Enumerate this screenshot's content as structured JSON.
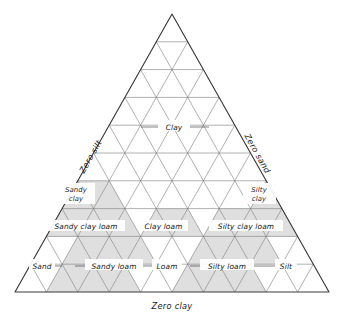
{
  "figure": {
    "name": "soil-texture-triangle",
    "type": "ternary-diagram"
  },
  "axes": {
    "left": {
      "label": "Zero silt"
    },
    "right": {
      "label": "Zero sand"
    },
    "bottom": {
      "label": "Zero clay"
    }
  },
  "regions": [
    {
      "id": "clay",
      "label": "Clay"
    },
    {
      "id": "sandy-clay",
      "label_line1": "Sandy",
      "label_line2": "clay"
    },
    {
      "id": "silty-clay",
      "label_line1": "Silty",
      "label_line2": "clay"
    },
    {
      "id": "sandy-clay-loam",
      "label": "Sandy clay loam"
    },
    {
      "id": "clay-loam",
      "label": "Clay loam"
    },
    {
      "id": "silty-clay-loam",
      "label": "Silty clay loam"
    },
    {
      "id": "sand",
      "label": "Sand"
    },
    {
      "id": "sandy-loam",
      "label": "Sandy loam"
    },
    {
      "id": "loam",
      "label": "Loam"
    },
    {
      "id": "silty-loam",
      "label": "Silty loam"
    },
    {
      "id": "silt",
      "label": "Silt"
    }
  ],
  "chart_data": {
    "type": "table",
    "title": "",
    "subdivisions": 10,
    "vertices": {
      "apex": {
        "x": 172,
        "y": 14,
        "meaning": "100% clay"
      },
      "bottom_left": {
        "x": 15,
        "y": 292,
        "meaning": "100% sand"
      },
      "bottom_right": {
        "x": 329,
        "y": 292,
        "meaning": "100% silt"
      }
    },
    "axis_labels": [
      "Zero silt",
      "Zero sand",
      "Zero clay"
    ],
    "categories": [
      "Clay",
      "Sandy clay",
      "Silty clay",
      "Sandy clay loam",
      "Clay loam",
      "Silty clay loam",
      "Sand",
      "Sandy loam",
      "Loam",
      "Silty loam",
      "Silt"
    ],
    "legend": [],
    "grid": true,
    "colors": {
      "shade": "#d9d9d9",
      "grid": "#6f6f6f",
      "outline": "#3a3a3a",
      "text": "#1a1a1a",
      "background": "#ffffff"
    }
  }
}
